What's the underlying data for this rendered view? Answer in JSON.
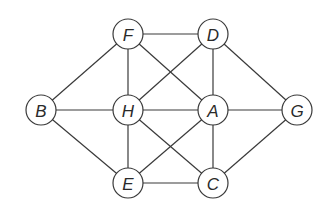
{
  "graph": {
    "radius": 15,
    "nodes": [
      {
        "id": "F",
        "label": "F",
        "x": 128,
        "y": 34
      },
      {
        "id": "D",
        "label": "D",
        "x": 213,
        "y": 34
      },
      {
        "id": "B",
        "label": "B",
        "x": 41,
        "y": 110
      },
      {
        "id": "H",
        "label": "H",
        "x": 128,
        "y": 110
      },
      {
        "id": "A",
        "label": "A",
        "x": 213,
        "y": 110
      },
      {
        "id": "G",
        "label": "G",
        "x": 297,
        "y": 110
      },
      {
        "id": "E",
        "label": "E",
        "x": 128,
        "y": 183
      },
      {
        "id": "C",
        "label": "C",
        "x": 213,
        "y": 183
      }
    ],
    "edges": [
      [
        "F",
        "D"
      ],
      [
        "F",
        "B"
      ],
      [
        "F",
        "H"
      ],
      [
        "F",
        "A"
      ],
      [
        "D",
        "H"
      ],
      [
        "D",
        "A"
      ],
      [
        "D",
        "G"
      ],
      [
        "B",
        "H"
      ],
      [
        "B",
        "E"
      ],
      [
        "H",
        "A"
      ],
      [
        "H",
        "E"
      ],
      [
        "H",
        "C"
      ],
      [
        "A",
        "G"
      ],
      [
        "A",
        "E"
      ],
      [
        "A",
        "C"
      ],
      [
        "G",
        "C"
      ],
      [
        "E",
        "C"
      ]
    ]
  }
}
